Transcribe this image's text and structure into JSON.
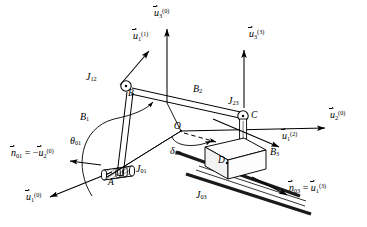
{
  "figure": {
    "type": "kinematic-mechanism-diagram",
    "background": "#ffffff",
    "ink": "#000000",
    "width": 367,
    "height": 227
  },
  "points": [
    {
      "id": "A",
      "label": "A",
      "x": 113,
      "y": 176
    },
    {
      "id": "B",
      "label": "B",
      "x": 131,
      "y": 93
    },
    {
      "id": "C",
      "label": "C",
      "x": 249,
      "y": 119
    },
    {
      "id": "D",
      "label": "D",
      "x": 227,
      "y": 163
    },
    {
      "id": "O",
      "label": "O",
      "x": 181,
      "y": 131
    }
  ],
  "bodies": [
    {
      "id": "B1",
      "label": "B",
      "index": "1",
      "x": 84,
      "y": 117
    },
    {
      "id": "B2",
      "label": "B",
      "index": "2",
      "x": 196,
      "y": 89
    },
    {
      "id": "B3",
      "label": "B",
      "index": "3",
      "x": 272,
      "y": 152
    }
  ],
  "joints": [
    {
      "id": "J01",
      "label": "J",
      "index": "01",
      "kind": "revolute",
      "x": 133,
      "y": 168
    },
    {
      "id": "J12",
      "label": "J",
      "index": "12",
      "kind": "revolute",
      "x": 101,
      "y": 79
    },
    {
      "id": "J23",
      "label": "J",
      "index": "23",
      "kind": "revolute",
      "x": 240,
      "y": 101
    },
    {
      "id": "J03",
      "label": "J",
      "index": "03",
      "kind": "prismatic",
      "x": 232,
      "y": 194
    }
  ],
  "angles": [
    {
      "id": "theta01",
      "symbol": "θ",
      "index": "01",
      "x": 73,
      "y": 141
    },
    {
      "id": "delta03",
      "symbol": "δ",
      "index": "03",
      "x": 174,
      "y": 151
    }
  ],
  "vectors": [
    {
      "id": "u3_0",
      "base": "u",
      "sub": "3",
      "sup": "(0)",
      "label_x": 156,
      "label_y": 12,
      "arrow": {
        "x1": 167,
        "y1": 103,
        "x2": 167,
        "y2": 27
      }
    },
    {
      "id": "u1_1",
      "base": "u",
      "sub": "1",
      "sup": "(1)",
      "label_x": 136,
      "label_y": 35,
      "arrow": {
        "x1": 121,
        "y1": 86,
        "x2": 148,
        "y2": 50
      }
    },
    {
      "id": "u3_3",
      "base": "u",
      "sub": "3",
      "sup": "(3)",
      "label_x": 268,
      "label_y": 33,
      "arrow": {
        "x1": 244,
        "y1": 108,
        "x2": 244,
        "y2": 49
      }
    },
    {
      "id": "u2_0",
      "base": "u",
      "sub": "2",
      "sup": "(0)",
      "label_x": 330,
      "label_y": 113,
      "arrow": {
        "x1": 184,
        "y1": 131,
        "x2": 327,
        "y2": 129
      }
    },
    {
      "id": "u1_2",
      "base": "u",
      "sub": "1",
      "sup": "(2)",
      "label_x": 283,
      "label_y": 135,
      "arrow": {
        "x1": 214,
        "y1": 120,
        "x2": 280,
        "y2": 148
      }
    },
    {
      "id": "u1_0",
      "base": "u",
      "sub": "1",
      "sup": "(0)",
      "label_x": 28,
      "label_y": 196,
      "arrow": {
        "x1": 110,
        "y1": 171,
        "x2": 48,
        "y2": 197
      }
    }
  ],
  "equations": [
    {
      "id": "n01",
      "lhs_base": "n",
      "lhs_sub": "01",
      "eq": "=",
      "rhs_sign": "−",
      "rhs_base": "u",
      "rhs_sub": "2",
      "rhs_sup": "(0)",
      "x": 13,
      "y": 152,
      "arrow": {
        "x1": 101,
        "y1": 164,
        "x2": 69,
        "y2": 161
      }
    },
    {
      "id": "n03",
      "lhs_base": "n",
      "lhs_sub": "03",
      "eq": "=",
      "rhs_sign": "",
      "rhs_base": "u",
      "rhs_sub": "1",
      "rhs_sup": "(3)",
      "x": 290,
      "y": 187,
      "arrow": {
        "x1": 253,
        "y1": 178,
        "x2": 288,
        "y2": 195
      }
    }
  ],
  "colors": {
    "ink": "#000000",
    "paper": "#ffffff",
    "rail": "#1a1a1a",
    "face_light": "#fdfdfd",
    "face_shade": "#f2f2f2"
  }
}
